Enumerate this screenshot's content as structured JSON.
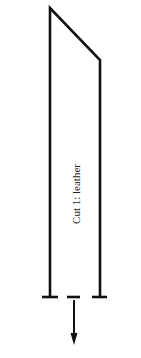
{
  "diagram": {
    "label": "Cut 1: leather",
    "stroke_color": "#111111"
  }
}
